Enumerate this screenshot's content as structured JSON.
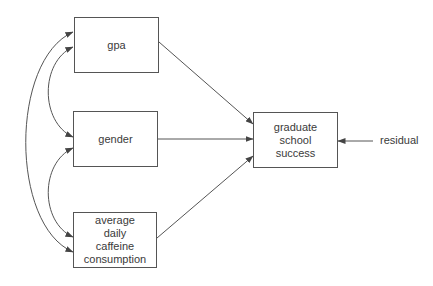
{
  "diagram": {
    "type": "path-diagram",
    "nodes": {
      "gpa": {
        "lines": [
          "gpa"
        ]
      },
      "gender": {
        "lines": [
          "gender"
        ]
      },
      "caffeine": {
        "lines": [
          "average",
          "daily",
          "caffeine",
          "consumption"
        ]
      },
      "outcome": {
        "lines": [
          "graduate",
          "school",
          "success"
        ]
      }
    },
    "error_term": {
      "label": "residual"
    },
    "edges": [
      {
        "from": "gpa",
        "to": "graduate school success",
        "type": "directed"
      },
      {
        "from": "gender",
        "to": "graduate school success",
        "type": "directed"
      },
      {
        "from": "average daily caffeine consumption",
        "to": "graduate school success",
        "type": "directed"
      },
      {
        "from": "residual",
        "to": "graduate school success",
        "type": "directed"
      },
      {
        "from": "gpa",
        "to": "gender",
        "type": "bidirectional-covariance"
      },
      {
        "from": "gender",
        "to": "average daily caffeine consumption",
        "type": "bidirectional-covariance"
      },
      {
        "from": "gpa",
        "to": "average daily caffeine consumption",
        "type": "bidirectional-covariance"
      }
    ],
    "colors": {
      "line": "#555555",
      "text": "#3a3a3a",
      "background": "#ffffff"
    }
  }
}
